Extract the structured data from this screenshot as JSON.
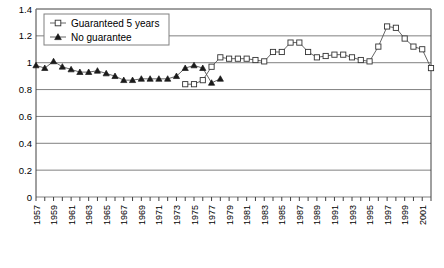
{
  "chart_data": {
    "type": "line",
    "title": "",
    "xlabel": "",
    "ylabel": "",
    "ylim": [
      0,
      1.4
    ],
    "ytick_labels": [
      "0",
      "0.2",
      "0.4",
      "0.6",
      "0.8",
      "1",
      "1.2",
      "1.4"
    ],
    "ytick_values": [
      0,
      0.2,
      0.4,
      0.6,
      0.8,
      1.0,
      1.2,
      1.4
    ],
    "grid": "horizontal",
    "legend_position": "top-left",
    "x": [
      1957,
      1958,
      1959,
      1960,
      1961,
      1962,
      1963,
      1964,
      1965,
      1966,
      1967,
      1968,
      1969,
      1970,
      1971,
      1972,
      1973,
      1974,
      1975,
      1976,
      1977,
      1978,
      1979,
      1980,
      1981,
      1982,
      1983,
      1984,
      1985,
      1986,
      1987,
      1988,
      1989,
      1990,
      1991,
      1992,
      1993,
      1994,
      1995,
      1996,
      1997,
      1998,
      1999,
      2000,
      2001,
      2002
    ],
    "xtick_labels": [
      "1957",
      "1959",
      "1961",
      "1963",
      "1965",
      "1967",
      "1969",
      "1971",
      "1973",
      "1975",
      "1977",
      "1979",
      "1981",
      "1983",
      "1985",
      "1987",
      "1989",
      "1991",
      "1993",
      "1995",
      "1997",
      "1999",
      "2001"
    ],
    "xtick_label_rotation": -90,
    "series": [
      {
        "name": "No guarantee",
        "marker": "filled-triangle",
        "x": [
          1957,
          1958,
          1959,
          1960,
          1961,
          1962,
          1963,
          1964,
          1965,
          1966,
          1967,
          1968,
          1969,
          1970,
          1971,
          1972,
          1973,
          1974
        ],
        "values": [
          0.98,
          0.96,
          1.01,
          0.97,
          0.95,
          0.93,
          0.93,
          0.94,
          0.92,
          0.9,
          0.87,
          0.87,
          0.88,
          0.88,
          0.88,
          0.88,
          0.9,
          0.96
        ]
      },
      {
        "name": "No guarantee (cont)",
        "marker": "filled-triangle",
        "x": [
          1974,
          1975,
          1976,
          1977,
          1978
        ],
        "values": [
          0.96,
          0.98,
          0.96,
          0.85,
          0.88
        ]
      },
      {
        "name": "Guaranteed 5 years",
        "marker": "open-square",
        "x": [
          1975,
          1976,
          1977,
          1978,
          1979,
          1980,
          1981,
          1982,
          1983,
          1984,
          1985,
          1986,
          1987,
          1988,
          1989,
          1990,
          1991,
          1992,
          1993,
          1994,
          1995,
          1996,
          1997,
          1998,
          1999,
          2000,
          2001,
          2002
        ],
        "values": [
          0.84,
          0.84,
          0.87,
          0.97,
          1.04,
          1.03,
          1.03,
          1.03,
          1.02,
          1.01,
          1.08,
          1.08,
          1.15,
          1.15,
          1.08,
          1.04,
          1.05,
          1.06,
          1.06,
          1.05,
          1.02,
          1.0,
          1.11,
          1.27,
          1.26,
          1.18,
          1.12,
          1.1
        ]
      }
    ],
    "series_points_guaranteed": [
      {
        "x": 1974,
        "y": 0.84
      },
      {
        "x": 1975,
        "y": 0.84
      },
      {
        "x": 1976,
        "y": 0.87
      },
      {
        "x": 1977,
        "y": 0.97
      },
      {
        "x": 1978,
        "y": 1.04
      },
      {
        "x": 1979,
        "y": 1.03
      },
      {
        "x": 1980,
        "y": 1.03
      },
      {
        "x": 1981,
        "y": 1.03
      },
      {
        "x": 1982,
        "y": 1.02
      },
      {
        "x": 1983,
        "y": 1.01
      },
      {
        "x": 1984,
        "y": 1.08
      },
      {
        "x": 1985,
        "y": 1.08
      },
      {
        "x": 1986,
        "y": 1.15
      },
      {
        "x": 1987,
        "y": 1.15
      },
      {
        "x": 1988,
        "y": 1.08
      },
      {
        "x": 1989,
        "y": 1.04
      },
      {
        "x": 1990,
        "y": 1.05
      },
      {
        "x": 1991,
        "y": 1.06
      },
      {
        "x": 1992,
        "y": 1.06
      },
      {
        "x": 1993,
        "y": 1.04
      },
      {
        "x": 1994,
        "y": 1.02
      },
      {
        "x": 1995,
        "y": 1.01
      },
      {
        "x": 1996,
        "y": 1.12
      },
      {
        "x": 1997,
        "y": 1.27
      },
      {
        "x": 1998,
        "y": 1.26
      },
      {
        "x": 1999,
        "y": 1.18
      },
      {
        "x": 2000,
        "y": 1.12
      },
      {
        "x": 2001,
        "y": 1.1
      },
      {
        "x": 2002,
        "y": 0.96
      }
    ],
    "annotations": []
  },
  "legend": {
    "items": [
      {
        "label": "Guaranteed 5 years",
        "marker": "open-square"
      },
      {
        "label": "No guarantee",
        "marker": "filled-triangle"
      }
    ]
  }
}
